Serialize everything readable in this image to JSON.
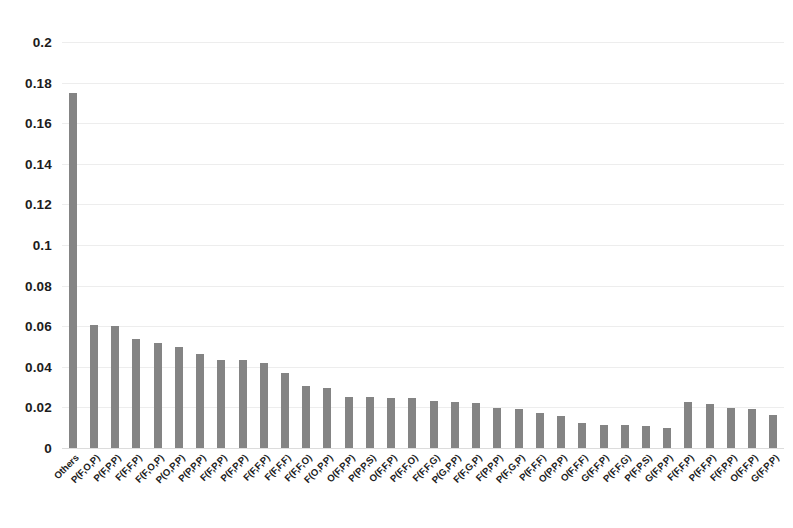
{
  "chart_data": {
    "type": "bar",
    "title": "",
    "subtitle": "",
    "xlabel": "",
    "ylabel": "",
    "ylim": [
      0,
      0.2
    ],
    "ytick_labels": [
      "0",
      "0.02",
      "0.04",
      "0.06",
      "0.08",
      "0.1",
      "0.12",
      "0.14",
      "0.16",
      "0.18",
      "0.2"
    ],
    "ytick_values": [
      0,
      0.02,
      0.04,
      0.06,
      0.08,
      0.1,
      0.12,
      0.14,
      0.16,
      0.18,
      0.2
    ],
    "grid": true,
    "grid_axis": "y",
    "legend": false,
    "legend_position": "none",
    "bar_color": "#848484",
    "background_color": "#ffffff",
    "gridline_color": "#ededed",
    "xtick_rotation": -45,
    "categories": [
      "Others",
      "P(F,O,P)",
      "P(F,P,P)",
      "F(F,F,P)",
      "F(F,O,P)",
      "P(O,P,P)",
      "P(P,P,P)",
      "F(F,P,P)",
      "P(F,P,P)",
      "F(F,F,P)",
      "F(F,F,F)",
      "F(F,F,O)",
      "F(O,P,P)",
      "O(F,P,P)",
      "P(P,P,S)",
      "O(F,F,P)",
      "P(F,F,O)",
      "F(F,F,G)",
      "P(G,P,P)",
      "F(F,G,P)",
      "F(P,P,P)",
      "P(F,G,P)",
      "P(F,F,F)",
      "O(P,P,P)",
      "O(F,F,F)",
      "G(F,F,P)",
      "P(F,F,G)",
      "P(F,P,S)",
      "G(F,P,P)",
      "F(F,F,P)",
      "P(F,F,P)",
      "F(F,P,P)",
      "O(F,F,P)",
      "G(F,P,P)"
    ],
    "values": [
      0.175,
      0.0605,
      0.06,
      0.0535,
      0.0515,
      0.05,
      0.0465,
      0.0435,
      0.0432,
      0.042,
      0.0368,
      0.0305,
      0.0298,
      0.0252,
      0.025,
      0.0248,
      0.0245,
      0.0232,
      0.0228,
      0.022,
      0.0198,
      0.0192,
      0.0172,
      0.016,
      0.0122,
      0.0115,
      0.0112,
      0.011,
      0.01,
      0.0225,
      0.0215,
      0.0195,
      0.019,
      0.0165
    ]
  }
}
